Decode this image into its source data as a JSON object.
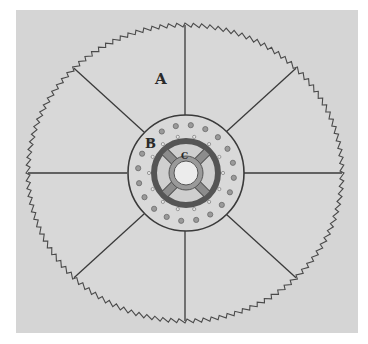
{
  "figure": {
    "background": {
      "page": "#ffffff",
      "panel": "#d5d5d5",
      "panel_box": [
        16,
        10,
        342,
        323
      ]
    },
    "colors": {
      "line": "#3a3a3a",
      "teeth": "#4a4a4a",
      "hub_fill": "#d9d9d9",
      "hub_dark": "#555555",
      "hole": "#6a6a6a"
    },
    "blade": {
      "cx": 185,
      "cy": 173,
      "rx": 159,
      "ry": 150,
      "teeth": 120,
      "tooth_depth": 4
    },
    "spokes": {
      "count": 8,
      "start_angle_deg": 0,
      "inner_r": 58
    },
    "hub": {
      "outer_r": 58,
      "dark_ring_r": 32,
      "dark_ring_width": 6,
      "center_hole_r": 12,
      "cross_arm_angle_deg": 45,
      "outer_holes": {
        "count": 20,
        "r": 48,
        "size": 2.6
      },
      "inner_holes": {
        "count": 14,
        "r": 37,
        "size": 1.6
      }
    },
    "labels": [
      {
        "id": "A",
        "text": "A",
        "x": 155,
        "y": 84,
        "size": 15
      },
      {
        "id": "B",
        "text": "B",
        "x": 145,
        "y": 148,
        "size": 13
      },
      {
        "id": "C",
        "text": "C",
        "x": 181,
        "y": 159,
        "size": 9
      }
    ]
  }
}
